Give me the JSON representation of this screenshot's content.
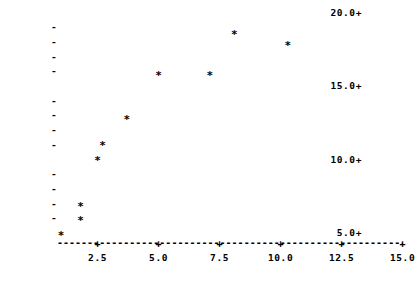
{
  "chart_data": {
    "type": "scatter",
    "title": "",
    "subtitle": "",
    "xlabel": "",
    "ylabel": "",
    "xlim": [
      0.5,
      15.6
    ],
    "ylim": [
      4.5,
      20.3
    ],
    "grid": false,
    "legend": null,
    "marker_glyph": "*",
    "axis_dash_glyph": "-",
    "axis_tick_glyph": "+",
    "x_ticks": [
      2.5,
      5.0,
      7.5,
      10.0,
      12.5,
      15.0
    ],
    "x_tick_labels": [
      "2.5",
      "5.0",
      "7.5",
      "10.0",
      "12.5",
      "15.0"
    ],
    "y_ticks": [
      5.0,
      10.0,
      15.0,
      20.0
    ],
    "y_tick_labels": [
      "5.0+",
      "10.0+",
      "15.0+",
      "20.0+"
    ],
    "y_minor_ticks": [
      6.0,
      7.0,
      8.0,
      9.0,
      11.0,
      12.0,
      13.0,
      14.0,
      16.0,
      17.0,
      18.0,
      19.0
    ],
    "y_minor_glyph": "-",
    "points": [
      {
        "x": 1.0,
        "y": 5.0
      },
      {
        "x": 1.8,
        "y": 6.0
      },
      {
        "x": 1.8,
        "y": 7.0
      },
      {
        "x": 2.5,
        "y": 10.1
      },
      {
        "x": 2.7,
        "y": 11.1
      },
      {
        "x": 3.7,
        "y": 12.9
      },
      {
        "x": 5.0,
        "y": 15.9
      },
      {
        "x": 7.1,
        "y": 15.9
      },
      {
        "x": 8.1,
        "y": 18.7
      },
      {
        "x": 10.3,
        "y": 17.9
      }
    ],
    "colors": {
      "background": "#ffffff",
      "foreground": "#000000",
      "marker": "#000000",
      "axis": "#000000"
    }
  },
  "geometry": {
    "x_origin_px": 61,
    "x_scale_px_per_unit": 24.4,
    "y_base_px": 233,
    "y_scale_px_per_unit": 14.7,
    "x_axis_y_px": 243
  }
}
